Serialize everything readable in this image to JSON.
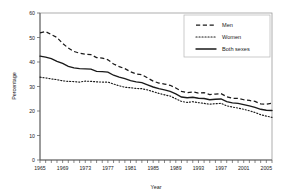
{
  "chart_data": {
    "type": "line",
    "title": "",
    "xlabel": "Year",
    "ylabel": "Percentage",
    "xlim": [
      1965,
      2006
    ],
    "ylim": [
      0,
      60
    ],
    "ytick_step": 10,
    "yticks": [
      0,
      10,
      20,
      30,
      40,
      50,
      60
    ],
    "xticks_labeled": [
      1965,
      1969,
      1973,
      1977,
      1981,
      1985,
      1989,
      1993,
      1997,
      2001,
      2005
    ],
    "xtick_minor_step": 1,
    "grid": false,
    "legend_position": "top-right",
    "x": [
      1965,
      1966,
      1967,
      1968,
      1969,
      1970,
      1971,
      1972,
      1973,
      1974,
      1975,
      1976,
      1977,
      1978,
      1979,
      1980,
      1981,
      1982,
      1983,
      1984,
      1985,
      1986,
      1987,
      1988,
      1989,
      1990,
      1991,
      1992,
      1993,
      1994,
      1995,
      1996,
      1997,
      1998,
      1999,
      2000,
      2001,
      2002,
      2003,
      2004,
      2005,
      2006
    ],
    "series": [
      {
        "name": "Men",
        "style": "dashed",
        "values": [
          51.9,
          52.4,
          51.2,
          50.0,
          47.6,
          45.7,
          44.3,
          43.6,
          43.2,
          43.0,
          41.8,
          41.6,
          40.9,
          39.2,
          38.1,
          37.3,
          36.0,
          35.1,
          34.8,
          33.5,
          32.2,
          31.4,
          31.0,
          30.5,
          29.4,
          28.0,
          27.5,
          27.8,
          27.3,
          27.5,
          26.7,
          26.9,
          27.1,
          25.8,
          25.2,
          25.2,
          24.6,
          24.3,
          23.9,
          22.9,
          22.8,
          23.2
        ]
      },
      {
        "name": "Women",
        "style": "dotted",
        "values": [
          33.8,
          33.5,
          33.1,
          32.8,
          32.3,
          32.1,
          32.0,
          31.8,
          32.2,
          32.1,
          31.9,
          31.8,
          31.8,
          31.0,
          30.3,
          29.7,
          29.5,
          29.2,
          29.1,
          28.6,
          27.9,
          27.2,
          26.6,
          26.1,
          25.0,
          23.9,
          23.5,
          23.8,
          23.4,
          23.1,
          22.8,
          23.0,
          23.1,
          22.1,
          21.6,
          21.2,
          20.7,
          20.1,
          19.4,
          18.5,
          17.9,
          17.4
        ]
      },
      {
        "name": "Both sexes",
        "style": "solid",
        "values": [
          42.4,
          42.0,
          41.4,
          40.3,
          39.4,
          38.2,
          37.6,
          37.3,
          37.2,
          37.1,
          36.2,
          36.1,
          35.9,
          34.6,
          33.8,
          33.2,
          32.4,
          31.9,
          31.6,
          30.7,
          29.8,
          29.1,
          28.6,
          28.0,
          27.0,
          25.7,
          25.4,
          25.6,
          25.2,
          25.1,
          24.6,
          24.8,
          24.9,
          23.8,
          23.3,
          23.1,
          22.6,
          22.1,
          21.5,
          20.7,
          20.3,
          20.2
        ]
      }
    ]
  },
  "legend": {
    "items": [
      {
        "label": "Men",
        "key": "men"
      },
      {
        "label": "Women",
        "key": "women"
      },
      {
        "label": "Both sexes",
        "key": "both"
      }
    ]
  },
  "axis_titles": {
    "y": "Percentage",
    "x": "Year"
  }
}
